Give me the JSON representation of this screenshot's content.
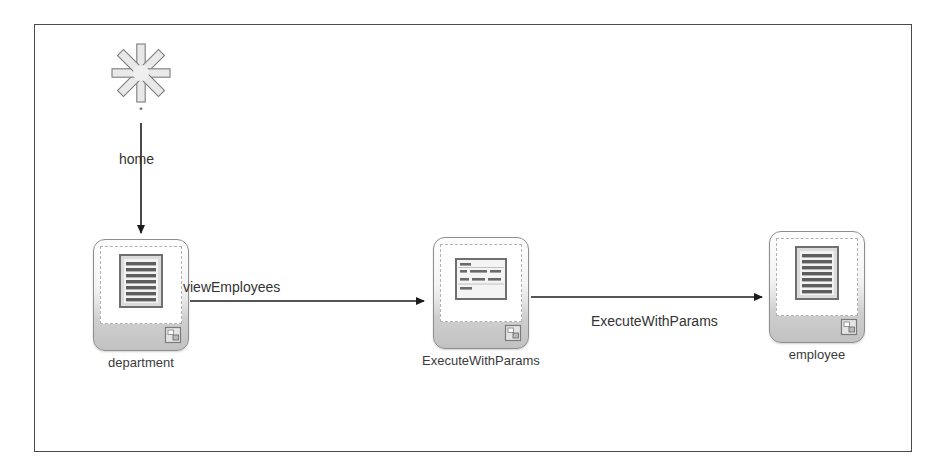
{
  "diagram": {
    "type": "adf-task-flow",
    "canvas": {
      "border_color": "#4a4a4a",
      "background": "#ffffff"
    },
    "start_node": {
      "icon": "wildcard-asterisk-icon",
      "label": "*"
    },
    "nodes": [
      {
        "id": "department",
        "label": "department",
        "icon": "view-page-document-icon",
        "badge": "page-fragment-badge-icon"
      },
      {
        "id": "ExecuteWithParams",
        "label": "ExecuteWithParams",
        "icon": "method-call-form-icon",
        "badge": "page-fragment-badge-icon"
      },
      {
        "id": "employee",
        "label": "employee",
        "icon": "view-page-document-icon",
        "badge": "page-fragment-badge-icon"
      }
    ],
    "edges": [
      {
        "id": "home",
        "label": "home",
        "from": "start",
        "to": "department",
        "direction": "down"
      },
      {
        "id": "viewEmployees",
        "label": "viewEmployees",
        "from": "department",
        "to": "ExecuteWithParams",
        "direction": "right"
      },
      {
        "id": "ExecuteWithParams",
        "label": "ExecuteWithParams",
        "from": "ExecuteWithParams",
        "to": "employee",
        "direction": "right"
      }
    ],
    "colors": {
      "line": "#1c1c1c",
      "node_border": "#8e8e8e",
      "node_fill_top": "#fdfdfd",
      "node_fill_bottom": "#c2c2c2",
      "text": "#333333"
    }
  }
}
